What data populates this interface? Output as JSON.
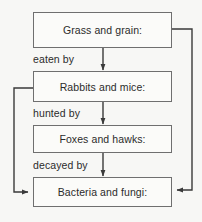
{
  "diagram": {
    "type": "flowchart",
    "background_color": "#f7f7f5",
    "box_fill_color": "#fbfbf9",
    "line_color": "#4a4a4a",
    "border_color": "#6f6f6f",
    "text_color": "#2b2b2b",
    "nodes": [
      {
        "id": "grass",
        "label": "Grass and grain:"
      },
      {
        "id": "rabbits",
        "label": "Rabbits and mice:"
      },
      {
        "id": "foxes",
        "label": "Foxes and hawks:"
      },
      {
        "id": "bacteria",
        "label": "Bacteria and fungi:"
      }
    ],
    "edges": [
      {
        "from": "grass",
        "to": "rabbits",
        "label": "eaten by"
      },
      {
        "from": "rabbits",
        "to": "foxes",
        "label": "hunted by"
      },
      {
        "from": "foxes",
        "to": "bacteria",
        "label": "decayed by"
      },
      {
        "from": "grass",
        "to": "bacteria",
        "label": ""
      },
      {
        "from": "rabbits",
        "to": "bacteria",
        "label": ""
      }
    ]
  }
}
